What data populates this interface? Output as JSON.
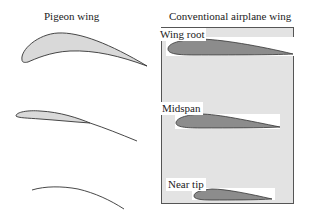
{
  "left_title": "Pigeon wing",
  "right_title": "Conventional airplane wing",
  "sections": [
    {
      "label": "Wing root"
    },
    {
      "label": "Midspan"
    },
    {
      "label": "Near tip"
    }
  ],
  "colors": {
    "pigeon_fill": "#d9d9d9",
    "airfoil_fill": "#8c8c8c",
    "panel_bg": "#e3e3e3",
    "stroke": "#333333"
  }
}
